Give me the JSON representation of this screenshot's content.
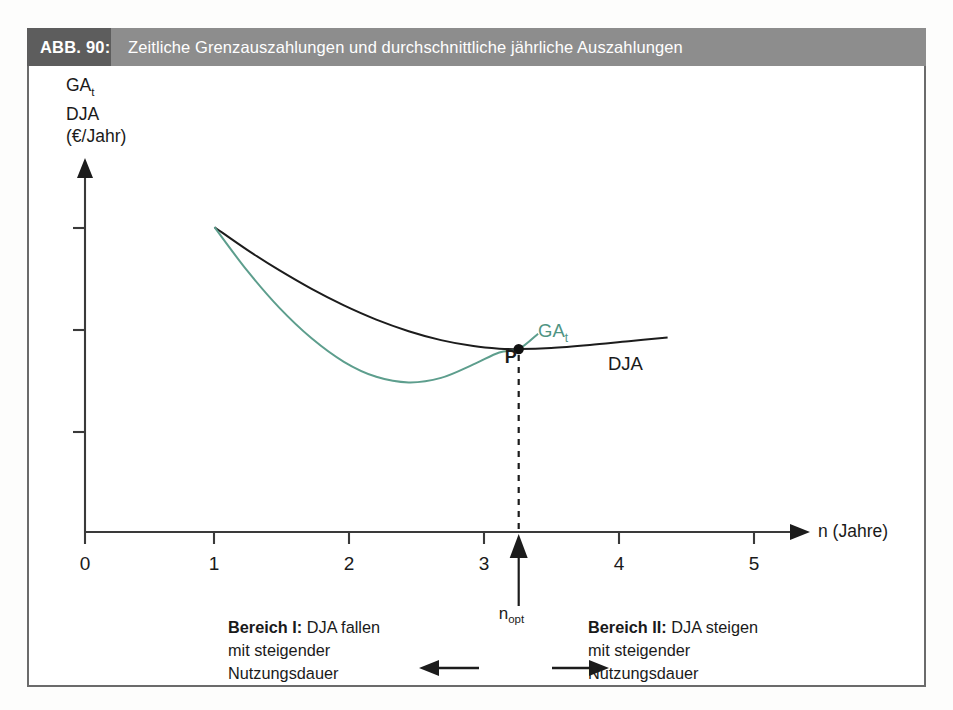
{
  "caption": {
    "number": "ABB. 90:",
    "title": "Zeitliche Grenzauszahlungen und durchschnittliche jährliche Auszahlungen"
  },
  "axes": {
    "y_label_line1": "GA",
    "y_label_line1_sub": "t",
    "y_label_line2": "DJA",
    "y_label_line3": "(€/Jahr)",
    "x_label": "n (Jahre)",
    "x_ticks": [
      "0",
      "1",
      "2",
      "3",
      "4",
      "5"
    ]
  },
  "annotations": {
    "curve_label_gat": "GA",
    "curve_label_gat_sub": "t",
    "curve_label_dja": "DJA",
    "point_label": "P",
    "nopt_label": "n",
    "nopt_label_sub": "opt",
    "region_left_title": "Bereich I:",
    "region_left_text1": " DJA fallen",
    "region_left_text2": "mit steigender",
    "region_left_text3": "Nutzungsdauer",
    "region_right_title": "Bereich II:",
    "region_right_text1": " DJA steigen",
    "region_right_text2": "mit steigender",
    "region_right_text3": "Nutzungsdauer"
  },
  "colors": {
    "gat_curve": "#5d9e8d",
    "dja_curve": "#1c1c1c",
    "caption_number_bg": "#5d5d5d",
    "caption_title_bg": "#8d8d8d",
    "frame_border": "#6b6b6b"
  },
  "chart_data": {
    "type": "line",
    "title": "Zeitliche Grenzauszahlungen und durchschnittliche jährliche Auszahlungen",
    "xlabel": "n (Jahre)",
    "ylabel": "GAt / DJA (€/Jahr)",
    "xlim": [
      0,
      5.6
    ],
    "ylim": [
      0,
      1.0
    ],
    "xticks": [
      0,
      1,
      2,
      3,
      4,
      5
    ],
    "yticks_unlabeled": 3,
    "grid": false,
    "legend": "inline-curve-labels",
    "series": [
      {
        "name": "DJA",
        "color": "#1c1c1c",
        "label_position": "right-of-curve",
        "x": [
          1.0,
          1.25,
          1.5,
          1.75,
          2.0,
          2.25,
          2.5,
          2.75,
          3.0,
          3.2,
          3.35,
          3.6,
          3.9,
          4.2,
          4.5
        ],
        "y": [
          0.815,
          0.755,
          0.7,
          0.65,
          0.606,
          0.568,
          0.537,
          0.513,
          0.497,
          0.49,
          0.489,
          0.492,
          0.5,
          0.51,
          0.52
        ]
      },
      {
        "name": "GAt",
        "color": "#5d9e8d",
        "label_position": "upper-right",
        "x": [
          1.0,
          1.25,
          1.5,
          1.75,
          2.0,
          2.25,
          2.5,
          2.75,
          3.0,
          3.2,
          3.35,
          3.5
        ],
        "y": [
          0.815,
          0.7,
          0.6,
          0.518,
          0.455,
          0.415,
          0.4,
          0.412,
          0.448,
          0.48,
          0.489,
          0.53
        ]
      }
    ],
    "annotations": [
      {
        "name": "P",
        "type": "point",
        "x": 3.35,
        "y": 0.489,
        "note": "intersection of GAt and DJA = minimum of DJA"
      },
      {
        "name": "n_opt",
        "type": "x-marker",
        "x": 3.35,
        "note": "optimal useful life, arrow pointing up to axis"
      },
      {
        "name": "Bereich I",
        "type": "region",
        "x_range": [
          0,
          3.35
        ],
        "text": "Bereich I: DJA fallen mit steigender Nutzungsdauer"
      },
      {
        "name": "Bereich II",
        "type": "region",
        "x_range": [
          3.35,
          5.6
        ],
        "text": "Bereich II: DJA steigen mit steigender Nutzungsdauer"
      }
    ]
  }
}
